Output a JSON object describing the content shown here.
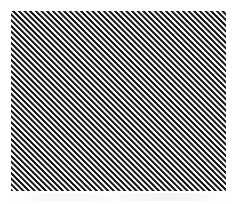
{
  "canvas": {
    "width": 238,
    "height": 204,
    "background_color": "#ffffff"
  },
  "swatch": {
    "label": "diagonal hatch pattern swatch",
    "left": 11,
    "top": 11,
    "width": 215,
    "height": 180,
    "stripe_angle_css": "45deg",
    "stripe_direction": "rising-left-to-right",
    "stripe_period_px": 4,
    "dark_color": "#1a1a1a",
    "mid_color": "#8a8a8a",
    "light_color": "#ffffff",
    "dark_band_px": 1.45,
    "mid_band_a_px": 1.85,
    "light_band_a_px": 2.2,
    "light_band_b_px": 3.5,
    "mid_band_b_px": 3.8
  },
  "artifact_band": {
    "label": "faint compression artifact band",
    "left": 8,
    "top": 193,
    "width": 222,
    "height": 8
  }
}
